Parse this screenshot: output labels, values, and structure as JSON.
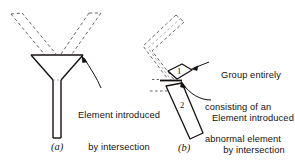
{
  "figure": {
    "title_caption_a": "(a)",
    "title_caption_b": "(b)",
    "colors": {
      "ink": "#14110f",
      "dashed_ink": "#6b6763",
      "background": "#ffffff"
    },
    "panel_a": {
      "caption": "(a)",
      "annotation": {
        "line1": "Element introduced",
        "line2": "by intersection",
        "line3": "of 3 groups"
      },
      "solid_shape_name": "funnel-with-stem",
      "dashed_arms_count": 2
    },
    "panel_b": {
      "caption": "(b)",
      "annotation_upper": {
        "line1": "Group entirely",
        "line2": "consisting of an",
        "line3": "abnormal element"
      },
      "annotation_lower": {
        "line1": "Element introduced",
        "line2": "by intersection"
      },
      "shape_labels": {
        "upper": "1",
        "lower": "2"
      },
      "dashed_outline_name": "bent-elbow-outline"
    }
  }
}
